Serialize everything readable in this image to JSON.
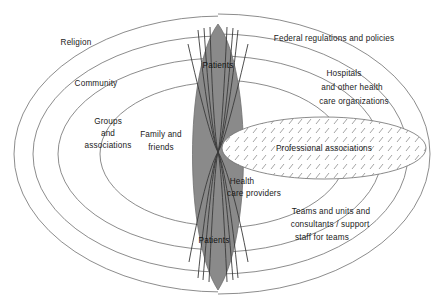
{
  "diagram": {
    "colors": {
      "center_lens_fill": "#8a8a8a",
      "ring_stroke": "#6f6f6f",
      "strand_stroke": "#3a3a3a",
      "hatch_stroke": "#9a9a9a",
      "background": "#ffffff",
      "text": "#1a1a1a"
    },
    "center": {
      "name": "patients-health-providers-lens",
      "labels": {
        "patients_top": "Patients",
        "patients_bottom": "Patients",
        "health_care_providers_line1": "Health",
        "health_care_providers_line2": "care providers"
      }
    },
    "left_spheres": [
      {
        "id": "religion",
        "label": "Religion"
      },
      {
        "id": "community",
        "label": "Community"
      },
      {
        "id": "groups-and-associations",
        "label_line1": "Groups",
        "label_line2": "and",
        "label_line3": "associations"
      },
      {
        "id": "family-and-friends",
        "label_line1": "Family and",
        "label_line2": "friends"
      }
    ],
    "right_spheres": [
      {
        "id": "federal-regulations-and-policies",
        "label": "Federal  regulations and policies"
      },
      {
        "id": "hospitals-and-other-health-care-organizations",
        "label_line1": "Hospitals",
        "label_line2": "and other health",
        "label_line3": "care organizations"
      },
      {
        "id": "teams-and-units",
        "label_line1": "Teams and units and",
        "label_line2": "consultants / support",
        "label_line3": "staff for teams"
      }
    ],
    "overlay_ellipse": {
      "id": "professional-associations",
      "label": "Professional associations",
      "fill_pattern": "diagonal-hatch"
    }
  }
}
